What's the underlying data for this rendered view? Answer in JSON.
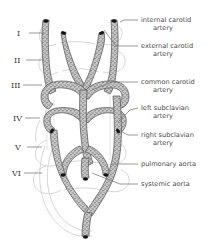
{
  "figure": {
    "background_color": "#ffffff",
    "ink_color": "#4a4a4a",
    "vessel_fill": "#b9b9b9",
    "vessel_stroke": "#4f4f4f",
    "ghost_stroke": "#c2c2c2",
    "leader_color": "#6e6e6e",
    "tip_color": "#1a1a1a"
  },
  "arch_numerals": [
    {
      "id": "arch-1",
      "label": "I",
      "x": 17,
      "y": 36,
      "leader_x2": 44,
      "leader_y": 33
    },
    {
      "id": "arch-2",
      "label": "II",
      "x": 14,
      "y": 63,
      "leader_x2": 44,
      "leader_y": 60
    },
    {
      "id": "arch-3",
      "label": "III",
      "x": 11,
      "y": 88,
      "leader_x2": 42,
      "leader_y": 85
    },
    {
      "id": "arch-4",
      "label": "IV",
      "x": 13,
      "y": 121,
      "leader_x2": 40,
      "leader_y": 118
    },
    {
      "id": "arch-5",
      "label": "V",
      "x": 15,
      "y": 150,
      "leader_x2": 42,
      "leader_y": 147
    },
    {
      "id": "arch-6",
      "label": "VI",
      "x": 12,
      "y": 176,
      "leader_x2": 42,
      "leader_y": 173
    }
  ],
  "labels": [
    {
      "id": "internal-carotid-artery",
      "lines": [
        "internal carotid",
        "artery"
      ],
      "x": 141,
      "y": 22,
      "leader": "M138,20 L124,20 L120,22"
    },
    {
      "id": "external-carotid-artery",
      "lines": [
        "external carotid",
        "artery"
      ],
      "x": 141,
      "y": 48,
      "leader": "M138,46 L116,46 L104,30"
    },
    {
      "id": "common-carotid-artery",
      "lines": [
        "common carotid",
        "artery"
      ],
      "x": 141,
      "y": 84,
      "leader": "M138,82 L112,82 L92,90"
    },
    {
      "id": "left-subclavian-artery",
      "lines": [
        "left subclavian",
        "artery"
      ],
      "x": 141,
      "y": 110,
      "leader": "M138,108 L130,110 L118,122"
    },
    {
      "id": "right-subclavian-artery",
      "lines": [
        "right subclavian",
        "artery"
      ],
      "x": 141,
      "y": 137,
      "leader": "M138,135 L128,135 L120,131"
    },
    {
      "id": "pulmonary-aorta",
      "lines": [
        "pulmonary aorta"
      ],
      "x": 141,
      "y": 166,
      "leader": "M138,164 L122,164 L112,164"
    },
    {
      "id": "systemic-aorta",
      "lines": [
        "systemic aorta"
      ],
      "x": 141,
      "y": 186,
      "leader": "M138,184 L120,184 L92,173"
    }
  ]
}
